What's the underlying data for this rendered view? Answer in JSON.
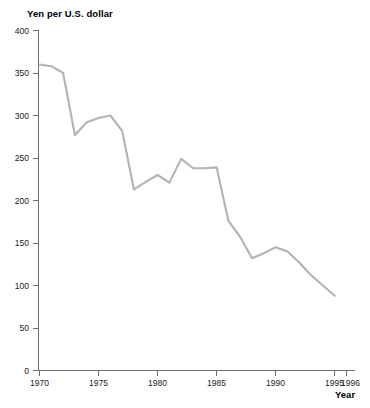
{
  "chart_data": {
    "type": "line",
    "title": "Yen per U.S. dollar",
    "xlabel": "Year",
    "ylabel": "",
    "xlim": [
      1970,
      1996
    ],
    "ylim": [
      0,
      400
    ],
    "grid": false,
    "legend": false,
    "legend_position": "none",
    "line_color": "#b3b3b3",
    "axis_color": "#6e6e6e",
    "x_ticks": [
      1970,
      1975,
      1980,
      1985,
      1990,
      1995,
      1996
    ],
    "x_tick_labels": [
      "1970",
      "1975",
      "1980",
      "1985",
      "1990",
      "1995",
      "1996"
    ],
    "y_ticks": [
      0,
      50,
      100,
      150,
      200,
      250,
      300,
      350,
      400
    ],
    "y_tick_labels": [
      "0",
      "50",
      "100",
      "150",
      "200",
      "250",
      "300",
      "350",
      "400"
    ],
    "series": [
      {
        "name": "Yen per U.S. dollar",
        "x": [
          1970,
          1971,
          1972,
          1973,
          1974,
          1975,
          1976,
          1977,
          1978,
          1979,
          1980,
          1981,
          1982,
          1983,
          1984,
          1985,
          1986,
          1987,
          1988,
          1989,
          1990,
          1991,
          1992,
          1993,
          1994,
          1995
        ],
        "values": [
          360,
          358,
          350,
          277,
          292,
          297,
          300,
          282,
          213,
          222,
          230,
          221,
          249,
          238,
          238,
          239,
          176,
          157,
          132,
          138,
          145,
          140,
          127,
          112,
          100,
          88
        ]
      }
    ]
  }
}
